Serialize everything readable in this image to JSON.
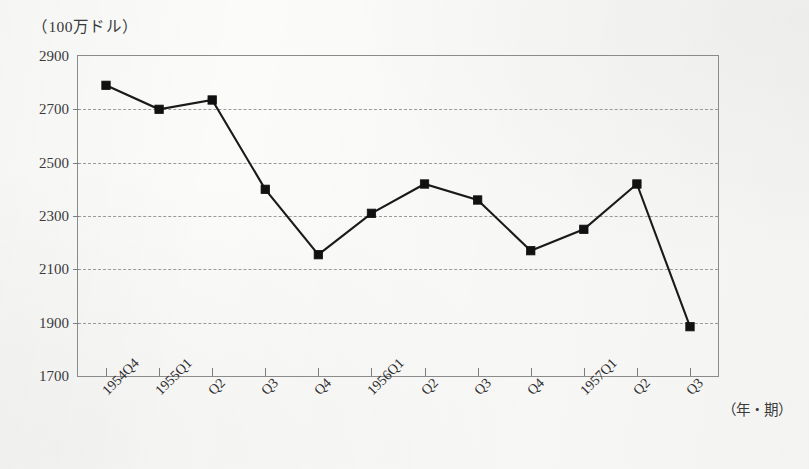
{
  "unit_label": "（100万ドル）",
  "xaxis_title": "（年・期）",
  "chart_data": {
    "type": "line",
    "title": "",
    "subtitle": "",
    "xlabel": "（年・期）",
    "ylabel": "（100万ドル）",
    "categories": [
      "1954Q4",
      "1955Q1",
      "Q2",
      "Q3",
      "Q4",
      "1956Q1",
      "Q2",
      "Q3",
      "Q4",
      "1957Q1",
      "Q2",
      "Q3"
    ],
    "values": [
      2790,
      2700,
      2735,
      2400,
      2155,
      2310,
      2420,
      2360,
      2170,
      2250,
      2420,
      1885
    ],
    "series": [
      {
        "name": "",
        "values": [
          2790,
          2700,
          2735,
          2400,
          2155,
          2310,
          2420,
          2360,
          2170,
          2250,
          2420,
          1885
        ]
      }
    ],
    "ylim": [
      1700,
      2900
    ],
    "ytick_labels": [
      "2900",
      "2700",
      "2500",
      "2300",
      "2100",
      "1900",
      "1700"
    ],
    "ytick_values": [
      2900,
      2700,
      2500,
      2300,
      2100,
      1900,
      1700
    ],
    "ystep": 200,
    "grid": "horizontal-dashed",
    "gridline_values": [
      2700,
      2500,
      2300,
      2100,
      1900
    ],
    "legend": "none",
    "marker": "square",
    "line_color": "#1a1a1a",
    "marker_color": "#111111",
    "grid_color": "#9a9a9a",
    "axis_color": "#8b8b8b",
    "xtick_label_rotation": -45,
    "annotations": []
  }
}
